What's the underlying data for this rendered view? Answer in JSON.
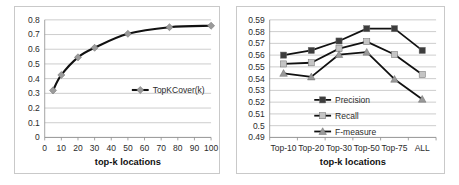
{
  "chart_data": [
    {
      "type": "line",
      "title": "",
      "xlabel": "top-k locations",
      "ylabel": "",
      "x": [
        5,
        10,
        20,
        30,
        50,
        75,
        100
      ],
      "series": [
        {
          "name": "TopKCover(k)",
          "values": [
            0.32,
            0.425,
            0.545,
            0.61,
            0.705,
            0.75,
            0.76
          ],
          "line_color": "#111111",
          "marker": "diamond",
          "marker_color": "#9a9a9a"
        }
      ],
      "xlim": [
        0,
        100
      ],
      "ylim": [
        0,
        0.8
      ],
      "xticks": [
        0,
        10,
        20,
        30,
        40,
        50,
        60,
        70,
        80,
        90,
        100
      ],
      "yticks": [
        0,
        0.1,
        0.2,
        0.3,
        0.4,
        0.5,
        0.6,
        0.7,
        0.8
      ],
      "ytick_labels": [
        "0",
        "0.1",
        "0.2",
        "0.3",
        "0.4",
        "0.5",
        "0.6",
        "0.7",
        "0.8"
      ],
      "xtick_labels": [
        "0",
        "10",
        "20",
        "30",
        "40",
        "50",
        "60",
        "70",
        "80",
        "90",
        "100"
      ],
      "grid": true,
      "legend_position": "inside-right"
    },
    {
      "type": "line",
      "title": "",
      "xlabel": "top-k locations",
      "ylabel": "",
      "categories": [
        "Top-10",
        "Top-20",
        "Top-30",
        "Top-50",
        "Top-75",
        "ALL"
      ],
      "series": [
        {
          "name": "Precision",
          "values": [
            0.56,
            0.564,
            0.572,
            0.5825,
            0.5825,
            0.564
          ],
          "line_color": "#111111",
          "marker": "square",
          "marker_color": "#3d3d3d"
        },
        {
          "name": "Recall",
          "values": [
            0.5525,
            0.5535,
            0.5655,
            0.5715,
            0.5605,
            0.5435
          ],
          "line_color": "#111111",
          "marker": "square",
          "marker_color": "#c4c4c4"
        },
        {
          "name": "F-measure",
          "values": [
            0.5445,
            0.5415,
            0.5605,
            0.5625,
            0.5395,
            0.5225
          ],
          "line_color": "#111111",
          "marker": "triangle",
          "marker_color": "#9a9a9a"
        }
      ],
      "ylim": [
        0.49,
        0.59
      ],
      "yticks": [
        0.49,
        0.5,
        0.51,
        0.52,
        0.53,
        0.54,
        0.55,
        0.56,
        0.57,
        0.58,
        0.59
      ],
      "ytick_labels": [
        "0.49",
        "0.5",
        "0.51",
        "0.52",
        "0.53",
        "0.54",
        "0.55",
        "0.56",
        "0.57",
        "0.58",
        "0.59"
      ],
      "xtick_labels": [
        "Top-10",
        "Top-20",
        "Top-30",
        "Top-50",
        "Top-75",
        "ALL"
      ],
      "grid": true,
      "legend_position": "inside-center"
    }
  ]
}
